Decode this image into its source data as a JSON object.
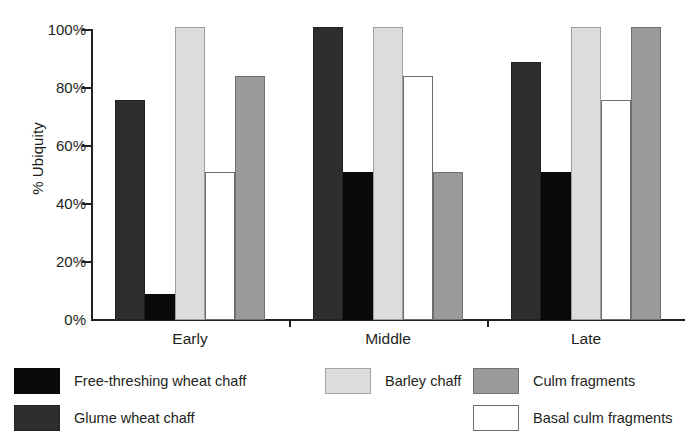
{
  "chart_data": {
    "type": "bar",
    "title": "",
    "subtitle": "",
    "xlabel": "",
    "ylabel": "% Ubiquity",
    "categories": [
      "Early",
      "Middle",
      "Late"
    ],
    "ylim": [
      0,
      100
    ],
    "yticks": [
      0,
      20,
      40,
      60,
      80,
      100
    ],
    "ytick_labels": [
      "0%",
      "20%",
      "40%",
      "60%",
      "80%",
      "100%"
    ],
    "grid": false,
    "legend_position": "bottom",
    "series": [
      {
        "name": "Glume wheat chaff",
        "color": "#2e2e2e",
        "outlined": false,
        "values": [
          76,
          101,
          89
        ]
      },
      {
        "name": "Free-threshing wheat chaff",
        "color": "#0a0a0a",
        "outlined": false,
        "values": [
          9,
          51,
          51
        ]
      },
      {
        "name": "Barley chaff",
        "color": "#dcdcdc",
        "outlined": false,
        "values": [
          101,
          101,
          101
        ]
      },
      {
        "name": "Basal culm fragments",
        "color": "#ffffff",
        "outlined": true,
        "values": [
          51,
          84,
          76
        ]
      },
      {
        "name": "Culm fragments",
        "color": "#9a9a9a",
        "outlined": false,
        "values": [
          84,
          51,
          101
        ]
      }
    ]
  },
  "legend": {
    "entries": [
      {
        "label": "Free-threshing wheat chaff",
        "color": "#0a0a0a",
        "outlined": false,
        "column": 0,
        "row": 0
      },
      {
        "label": "Glume wheat chaff",
        "color": "#2e2e2e",
        "outlined": false,
        "column": 0,
        "row": 1
      },
      {
        "label": "Barley chaff",
        "color": "#dcdcdc",
        "outlined": false,
        "column": 1,
        "row": 0
      },
      {
        "label": "Culm fragments",
        "color": "#9a9a9a",
        "outlined": false,
        "column": 2,
        "row": 0
      },
      {
        "label": "Basal culm fragments",
        "color": "#ffffff",
        "outlined": true,
        "column": 2,
        "row": 1
      }
    ]
  },
  "axes": {
    "y_title": "% Ubiquity",
    "y_tick_labels": [
      "100%",
      "80%",
      "60%",
      "40%",
      "20%",
      "0%"
    ],
    "x_tick_labels": [
      "Early",
      "Middle",
      "Late"
    ]
  }
}
